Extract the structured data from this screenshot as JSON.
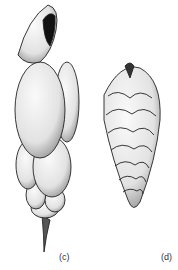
{
  "figure": {
    "panels": [
      {
        "id": "c",
        "label": "(c)",
        "description": "elongated multi-chambered shell, aperture at top, spine at base"
      },
      {
        "id": "d",
        "label": "(d)",
        "description": "biserial tapering shell with chevron-arranged chambers"
      }
    ]
  }
}
